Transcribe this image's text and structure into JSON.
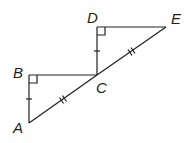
{
  "diagram": {
    "type": "geometry",
    "points": {
      "A": {
        "label": "A",
        "x": 29,
        "y": 123
      },
      "B": {
        "label": "B",
        "x": 29,
        "y": 75
      },
      "C": {
        "label": "C",
        "x": 97,
        "y": 75
      },
      "D": {
        "label": "D",
        "x": 97,
        "y": 27
      },
      "E": {
        "label": "E",
        "x": 166,
        "y": 27
      }
    },
    "segments": [
      "AB",
      "BC",
      "AC",
      "CD",
      "DE",
      "CE"
    ],
    "right_angles": [
      "B",
      "D"
    ],
    "congruence_marks": {
      "single_tick": [
        "AB",
        "CD"
      ],
      "double_tick": [
        "AC",
        "CE"
      ]
    },
    "stroke_color": "#231f20"
  }
}
